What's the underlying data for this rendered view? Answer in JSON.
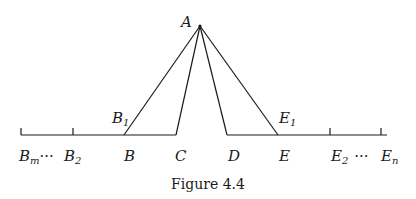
{
  "figure": {
    "caption": "Figure 4.4",
    "apex": {
      "label": "A",
      "x": 200,
      "y": 26
    },
    "baseline_y": 135,
    "labels": {
      "A": "A",
      "B1": "B",
      "B1_sub": "1",
      "E1": "E",
      "E1_sub": "1",
      "Bm": "B",
      "Bm_sub": "m",
      "dots_left": "···",
      "B2": "B",
      "B2_sub": "2",
      "B": "B",
      "C": "C",
      "D": "D",
      "E": "E",
      "E2": "E",
      "E2_sub": "2",
      "dots_right": "···",
      "En": "E",
      "En_sub": "n"
    },
    "points": {
      "Bm": 21,
      "B2": 73,
      "B": 124,
      "C": 176,
      "D": 227,
      "E": 278,
      "E2": 330,
      "En": 381
    },
    "segments": [
      {
        "from": "A",
        "to": "B"
      },
      {
        "from": "A",
        "to": "C"
      },
      {
        "from": "A",
        "to": "D"
      },
      {
        "from": "A",
        "to": "E"
      }
    ]
  }
}
